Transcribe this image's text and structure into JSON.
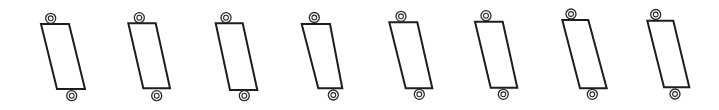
{
  "canvas": {
    "width": 719,
    "height": 110,
    "background": "#ffffff",
    "stroke": "#1e1e1e"
  },
  "figure": {
    "count": 8,
    "items": [
      {
        "id": 1,
        "body": [
          [
            41,
            24
          ],
          [
            69,
            24
          ],
          [
            85,
            89
          ],
          [
            57,
            89
          ]
        ],
        "top_eyelet": [
          50.7,
          18.3
        ],
        "bottom_eyelet": [
          71.7,
          95.7
        ]
      },
      {
        "id": 2,
        "body": [
          [
            128.3,
            23.3
          ],
          [
            155.7,
            23.3
          ],
          [
            170,
            88.3
          ],
          [
            143.3,
            88.3
          ]
        ],
        "top_eyelet": [
          139.3,
          17.7
        ],
        "bottom_eyelet": [
          156.7,
          95.7
        ]
      },
      {
        "id": 3,
        "body": [
          [
            215.7,
            23.3
          ],
          [
            242.7,
            23.3
          ],
          [
            257.3,
            90
          ],
          [
            230,
            90
          ]
        ],
        "top_eyelet": [
          226,
          17.7
        ],
        "bottom_eyelet": [
          244.3,
          95.7
        ]
      },
      {
        "id": 4,
        "body": [
          [
            301.7,
            24
          ],
          [
            330,
            24
          ],
          [
            342.3,
            88.3
          ],
          [
            318.3,
            88.3
          ]
        ],
        "top_eyelet": [
          314.3,
          17.5
        ],
        "bottom_eyelet": [
          333.3,
          95
        ]
      },
      {
        "id": 5,
        "body": [
          [
            389.3,
            22.3
          ],
          [
            417.3,
            22.3
          ],
          [
            432.3,
            88.3
          ],
          [
            405.7,
            88.3
          ]
        ],
        "top_eyelet": [
          401,
          16.3
        ],
        "bottom_eyelet": [
          419.3,
          94.3
        ]
      },
      {
        "id": 6,
        "body": [
          [
            475,
            21.7
          ],
          [
            502.7,
            21.7
          ],
          [
            517.3,
            87.7
          ],
          [
            490.7,
            87.7
          ]
        ],
        "top_eyelet": [
          486,
          15.7
        ],
        "bottom_eyelet": [
          503.3,
          94.3
        ]
      },
      {
        "id": 7,
        "body": [
          [
            562.3,
            20
          ],
          [
            588.3,
            20
          ],
          [
            606.7,
            88.3
          ],
          [
            580,
            88.3
          ]
        ],
        "top_eyelet": [
          571,
          14
        ],
        "bottom_eyelet": [
          592.3,
          94.3
        ]
      },
      {
        "id": 8,
        "body": [
          [
            647.3,
            20.7
          ],
          [
            673.3,
            20.7
          ],
          [
            689.3,
            87.3
          ],
          [
            664,
            87.3
          ]
        ],
        "top_eyelet": [
          655.7,
          14.5
        ],
        "bottom_eyelet": [
          675,
          94
        ]
      }
    ],
    "eyelet": {
      "outer_radius": 5,
      "inner_radius": 2.4
    }
  }
}
